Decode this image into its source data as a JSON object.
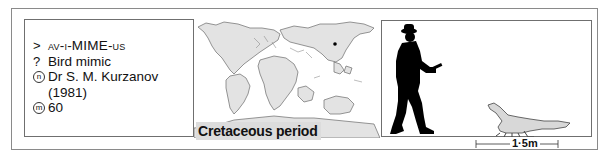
{
  "info": {
    "pronunciation": {
      "icon": "pronunciation-chevron-icon",
      "symbol": ">",
      "text": "av-i-MIME-us"
    },
    "meaning": {
      "icon": "question-mark-icon",
      "symbol": "?",
      "text": "Bird mimic"
    },
    "named_by": {
      "icon": "n-circle-icon",
      "symbol": "n",
      "text": "Dr S. M. Kurzanov",
      "year": "(1981)"
    },
    "myr": {
      "icon": "m-circle-icon",
      "symbol": "m",
      "text": "60"
    }
  },
  "map": {
    "caption": "Cretaceous period",
    "land_color": "#e3e3e3",
    "outline_color": "#6a6a6a",
    "location_marker": "dot"
  },
  "scale": {
    "length_label": "1·5m",
    "silhouette_human": "human-silhouette",
    "silhouette_dinosaur": "avimimus-silhouette",
    "dinosaur_color": "#d8d8d8"
  }
}
